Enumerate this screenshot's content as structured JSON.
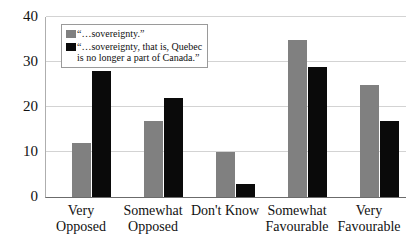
{
  "chart_data": {
    "type": "bar",
    "title": "",
    "subtitle": "",
    "xlabel": "",
    "ylabel": "",
    "ylim": [
      0,
      40
    ],
    "yticks": [
      0,
      10,
      20,
      30,
      40
    ],
    "grid": true,
    "legend_position": "top-left inside plot",
    "categories": [
      "Very\nOpposed",
      "Somewhat\nOpposed",
      "Don't Know",
      "Somewhat\nFavourable",
      "Very\nFavourable"
    ],
    "series": [
      {
        "name": "“…sovereignty.”",
        "color": "#808080",
        "values": [
          12,
          17,
          10,
          35,
          25
        ]
      },
      {
        "name": "“…sovereignty, that is, Quebec\n is no longer a part of Canada.”",
        "color": "#0a0a0a",
        "values": [
          28,
          22,
          3,
          29,
          17
        ]
      }
    ]
  },
  "axis": {
    "y_tick_labels": [
      "40",
      "30",
      "20",
      "10",
      "0"
    ]
  },
  "legend": {
    "entries": [
      {
        "label": "“…sovereignty.”",
        "color": "#808080"
      },
      {
        "label": "“…sovereignty, that is, Quebec\n is no longer a part of Canada.”",
        "color": "#0a0a0a"
      }
    ]
  },
  "colors": {
    "series_a": "#808080",
    "series_b": "#0a0a0a",
    "gridline": "#d3d3d3",
    "axis": "#6b6b6b",
    "background": "#ffffff",
    "text": "#111111"
  }
}
